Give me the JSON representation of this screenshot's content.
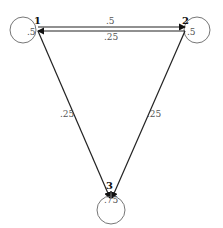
{
  "diagram": {
    "type": "markov-chain",
    "nodes": [
      {
        "id": "1",
        "label": "1",
        "self_loop": ".5"
      },
      {
        "id": "2",
        "label": "2",
        "self_loop": ".5"
      },
      {
        "id": "3",
        "label": "3",
        "self_loop": ".75"
      }
    ],
    "edges": [
      {
        "from": "1",
        "to": "2",
        "label": ".5"
      },
      {
        "from": "2",
        "to": "1",
        "label": ".25"
      },
      {
        "from": "1",
        "to": "3",
        "label": ".25"
      },
      {
        "from": "2",
        "to": "3",
        "label": ".25"
      }
    ]
  }
}
